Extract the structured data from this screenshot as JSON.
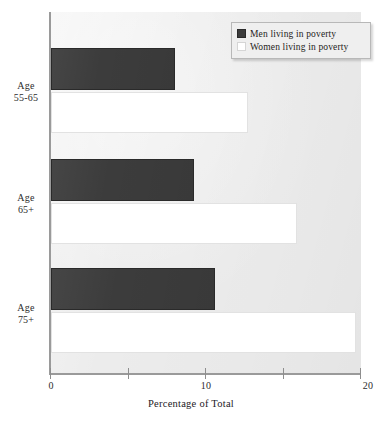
{
  "chart_data": {
    "type": "bar",
    "orientation": "horizontal",
    "title": "",
    "xlabel": "Percentage of Total",
    "ylabel": "",
    "categories": [
      "Age 55-65",
      "Age 65+",
      "Age 75+"
    ],
    "category_lines": [
      [
        "Age",
        "55-65"
      ],
      [
        "Age",
        "65+"
      ],
      [
        "Age",
        "75+"
      ]
    ],
    "series": [
      {
        "name": "Men living in poverty",
        "values": [
          8.0,
          9.2,
          10.6
        ]
      },
      {
        "name": "Women living in poverty",
        "values": [
          12.7,
          15.9,
          19.7
        ]
      }
    ],
    "xlim": [
      0,
      20
    ],
    "xticks": [
      0,
      5,
      10,
      15,
      20
    ],
    "xtick_labels": [
      "0",
      "",
      "10",
      "",
      "20"
    ],
    "grid": false,
    "legend_position": "top-right",
    "colors": {
      "men": "#3c3c3c",
      "women": "#ffffff",
      "plot_background": "#ececec",
      "axis": "#9a9a9a",
      "text": "#2c2c2c"
    }
  },
  "legend": {
    "items": [
      {
        "label": "Men living in poverty",
        "swatch": "dark-square-swatch"
      },
      {
        "label": "Women living in poverty",
        "swatch": "white-square-swatch"
      }
    ]
  },
  "axis": {
    "x_title": "Percentage of Total",
    "x_labels": {
      "t0": "0",
      "t10": "10",
      "t20": "20"
    }
  }
}
